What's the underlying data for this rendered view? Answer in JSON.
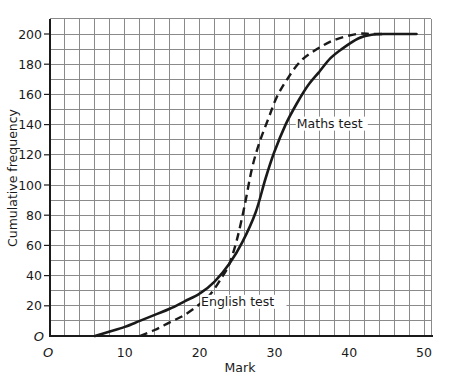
{
  "chart_data": {
    "type": "line",
    "title": "",
    "xlabel": "Mark",
    "ylabel": "Cumulative frequency",
    "xlim": [
      0,
      51
    ],
    "ylim": [
      0,
      210
    ],
    "x_ticks": [
      10,
      20,
      30,
      40,
      50
    ],
    "y_ticks": [
      20,
      40,
      60,
      80,
      100,
      120,
      140,
      160,
      180,
      200
    ],
    "origin_label_x": "O",
    "origin_label_y": "O",
    "grid": {
      "on": true,
      "x_step": 2,
      "y_step": 10
    },
    "legend": "none (curves labelled directly)",
    "series": [
      {
        "name": "Maths test",
        "style": "solid",
        "label_position": {
          "x": 33,
          "y": 138
        },
        "points": [
          [
            6,
            0
          ],
          [
            8,
            3
          ],
          [
            10,
            6
          ],
          [
            12,
            10
          ],
          [
            14,
            14
          ],
          [
            16,
            18
          ],
          [
            18,
            23
          ],
          [
            20,
            28
          ],
          [
            22,
            36
          ],
          [
            24,
            48
          ],
          [
            25.7,
            62
          ],
          [
            27.5,
            82
          ],
          [
            28.8,
            104
          ],
          [
            30,
            122
          ],
          [
            31.5,
            140
          ],
          [
            33,
            154
          ],
          [
            34.5,
            166
          ],
          [
            36,
            175
          ],
          [
            37.5,
            184
          ],
          [
            39,
            190
          ],
          [
            41.2,
            197
          ],
          [
            43,
            199.5
          ],
          [
            45,
            200
          ],
          [
            47,
            200
          ],
          [
            49,
            200
          ]
        ]
      },
      {
        "name": "English test",
        "style": "dashed",
        "label_position": {
          "x": 20.2,
          "y": 20
        },
        "points": [
          [
            12,
            0
          ],
          [
            14,
            4
          ],
          [
            16,
            9
          ],
          [
            18,
            14
          ],
          [
            20,
            21
          ],
          [
            21.5,
            28
          ],
          [
            23,
            39
          ],
          [
            24,
            48
          ],
          [
            25,
            64
          ],
          [
            26,
            86
          ],
          [
            27,
            111
          ],
          [
            28,
            128
          ],
          [
            29.2,
            144
          ],
          [
            30.3,
            158
          ],
          [
            31.7,
            170
          ],
          [
            33.5,
            182
          ],
          [
            35.7,
            190
          ],
          [
            38,
            196
          ],
          [
            41,
            200
          ],
          [
            43,
            200
          ],
          [
            45,
            200
          ]
        ]
      }
    ]
  }
}
